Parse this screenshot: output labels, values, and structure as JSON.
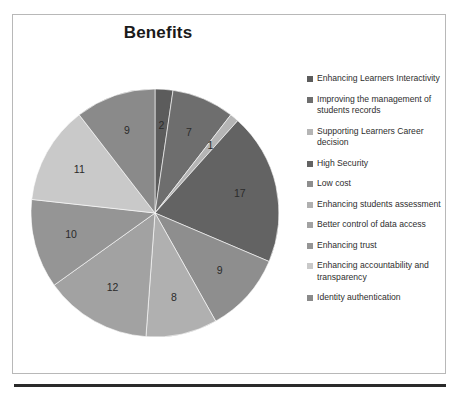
{
  "chart_data": {
    "type": "pie",
    "title": "Benefits",
    "xlabel": "",
    "ylabel": "",
    "legend_position": "right",
    "grid": false,
    "total": 86,
    "categories": [
      "Enhancing Learners Interactivity",
      "Improving the management of students records",
      "Supporting Learners Career decision",
      "High Security",
      "Low cost",
      "Enhancing students assessment",
      "Better control of data access",
      "Enhancing trust",
      "Enhancing accountability and transparency",
      "Identity authentication"
    ],
    "values": [
      2,
      7,
      1,
      17,
      9,
      8,
      12,
      10,
      11,
      9
    ],
    "data_labels": [
      "2",
      "7",
      "1",
      "17",
      "9",
      "8",
      "12",
      "10",
      "11",
      "9"
    ],
    "colors": [
      "#5c5c5c",
      "#6e6e6e",
      "#b5b5b5",
      "#636363",
      "#8e8e8e",
      "#b0b0b0",
      "#a2a2a2",
      "#959595",
      "#c9c9c9",
      "#8a8a8a"
    ]
  },
  "legend": {
    "items": [
      {
        "label": "Enhancing Learners Interactivity",
        "color": "#5c5c5c"
      },
      {
        "label": "Improving the management of students records",
        "color": "#6e6e6e"
      },
      {
        "label": "Supporting Learners Career decision",
        "color": "#b5b5b5"
      },
      {
        "label": "High Security",
        "color": "#636363"
      },
      {
        "label": "Low cost",
        "color": "#8e8e8e"
      },
      {
        "label": "Enhancing students assessment",
        "color": "#b0b0b0"
      },
      {
        "label": "Better control of data access",
        "color": "#a2a2a2"
      },
      {
        "label": "Enhancing trust",
        "color": "#959595"
      },
      {
        "label": "Enhancing accountability and transparency",
        "color": "#c9c9c9"
      },
      {
        "label": "Identity authentication",
        "color": "#8a8a8a"
      }
    ]
  },
  "footer": {
    "clipped_text": ""
  }
}
